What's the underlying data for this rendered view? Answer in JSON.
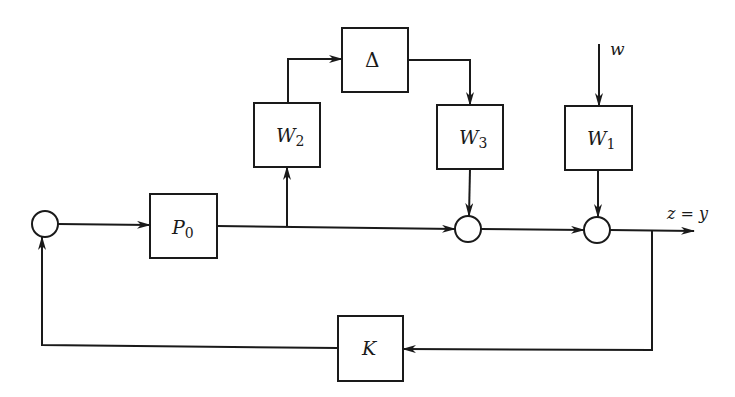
{
  "diagram": {
    "type": "block-diagram",
    "colors": {
      "stroke": "#1a1a1a",
      "background": "#ffffff"
    },
    "blocks": [
      {
        "id": "P0",
        "main": "P",
        "sub": "0"
      },
      {
        "id": "W2",
        "main": "W",
        "sub": "2"
      },
      {
        "id": "Delta",
        "main": "Δ",
        "sub": ""
      },
      {
        "id": "W3",
        "main": "W",
        "sub": "3"
      },
      {
        "id": "W1",
        "main": "W",
        "sub": "1"
      },
      {
        "id": "K",
        "main": "K",
        "sub": ""
      }
    ],
    "summing_junctions": 3,
    "signals": {
      "disturbance": "w",
      "output": "z = y"
    }
  }
}
